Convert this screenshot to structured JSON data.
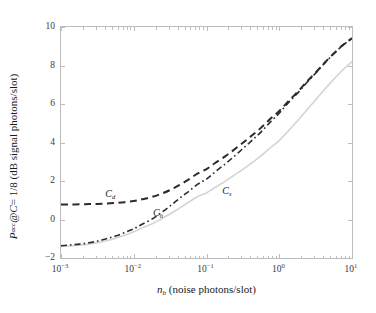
{
  "figure": {
    "xlabel_prefix": "n",
    "xlabel_sub": "b",
    "xlabel_rest": " (noise photons/slot)",
    "ylabel_p": "P",
    "ylabel_p_sub": "acc",
    "ylabel_mid": " @ ",
    "ylabel_c": "C",
    "ylabel_eq": " = 1/8 (dB signal photons/slot)"
  },
  "chart_data": {
    "type": "line",
    "title": "",
    "xlabel": "n_b (noise photons/slot)",
    "ylabel": "P_acc @ C = 1/8 (dB signal photons/slot)",
    "xscale": "log",
    "yscale": "linear",
    "xlim": [
      0.001,
      10
    ],
    "ylim": [
      -2,
      10
    ],
    "grid": false,
    "legend": "inline-annotations",
    "xticks": [
      "10^-3",
      "10^-2",
      "10^-1",
      "10^0",
      "10^1"
    ],
    "xtick_values": [
      0.001,
      0.01,
      0.1,
      1,
      10
    ],
    "yticks": [
      "-2",
      "0",
      "2",
      "4",
      "6",
      "8",
      "10"
    ],
    "ytick_values": [
      -2,
      0,
      2,
      4,
      6,
      8,
      10
    ],
    "annotations": [
      {
        "label": "C",
        "sub": "d",
        "x": 0.0042,
        "y": 1.28
      },
      {
        "label": "C",
        "sub": "h",
        "x": 0.019,
        "y": 0.3
      },
      {
        "label": "C",
        "sub": "s",
        "x": 0.17,
        "y": 1.42
      }
    ],
    "series": [
      {
        "name": "C_d",
        "style": "dashed",
        "color": "#2b2b2b",
        "width": 2.0,
        "x": [
          0.001,
          0.0013,
          0.0018,
          0.0024,
          0.0032,
          0.0042,
          0.0056,
          0.0075,
          0.01,
          0.013,
          0.018,
          0.024,
          0.032,
          0.042,
          0.056,
          0.075,
          0.1,
          0.13,
          0.18,
          0.24,
          0.32,
          0.42,
          0.56,
          0.75,
          1.0,
          1.3,
          1.8,
          2.4,
          3.2,
          4.2,
          5.6,
          7.5,
          10.0
        ],
        "y": [
          0.78,
          0.78,
          0.79,
          0.8,
          0.81,
          0.83,
          0.86,
          0.9,
          0.96,
          1.05,
          1.18,
          1.34,
          1.54,
          1.78,
          2.06,
          2.38,
          2.62,
          2.92,
          3.28,
          3.63,
          4.0,
          4.36,
          4.76,
          5.22,
          5.64,
          6.1,
          6.64,
          7.16,
          7.65,
          8.14,
          8.62,
          9.06,
          9.42
        ]
      },
      {
        "name": "C_h",
        "style": "dashdot",
        "color": "#2b2b2b",
        "width": 1.6,
        "x": [
          0.001,
          0.0013,
          0.0018,
          0.0024,
          0.0032,
          0.0042,
          0.0056,
          0.0075,
          0.01,
          0.013,
          0.018,
          0.024,
          0.032,
          0.042,
          0.056,
          0.075,
          0.1,
          0.13,
          0.18,
          0.24,
          0.32,
          0.42,
          0.56,
          0.75,
          1.0,
          1.3,
          1.8,
          2.4,
          3.2,
          4.2,
          5.6,
          7.5,
          10.0
        ],
        "y": [
          -1.36,
          -1.33,
          -1.28,
          -1.21,
          -1.12,
          -1.0,
          -0.86,
          -0.68,
          -0.48,
          -0.25,
          0.03,
          0.36,
          0.72,
          1.08,
          1.44,
          1.82,
          2.1,
          2.46,
          2.88,
          3.28,
          3.7,
          4.1,
          4.54,
          5.06,
          5.52,
          6.02,
          6.58,
          7.12,
          7.62,
          8.12,
          8.6,
          9.05,
          9.42
        ]
      },
      {
        "name": "C_s",
        "style": "solid",
        "color": "#d4d4d4",
        "width": 1.6,
        "x": [
          0.001,
          0.0013,
          0.0018,
          0.0024,
          0.0032,
          0.0042,
          0.0056,
          0.0075,
          0.01,
          0.013,
          0.018,
          0.024,
          0.032,
          0.042,
          0.056,
          0.075,
          0.1,
          0.13,
          0.18,
          0.24,
          0.32,
          0.42,
          0.56,
          0.75,
          1.0,
          1.3,
          1.8,
          2.4,
          3.2,
          4.2,
          5.6,
          7.5,
          10.0
        ],
        "y": [
          -1.4,
          -1.38,
          -1.34,
          -1.28,
          -1.2,
          -1.1,
          -0.97,
          -0.82,
          -0.64,
          -0.44,
          -0.22,
          0.04,
          0.3,
          0.58,
          0.88,
          1.18,
          1.38,
          1.66,
          1.98,
          2.3,
          2.62,
          2.94,
          3.3,
          3.72,
          4.1,
          4.56,
          5.14,
          5.7,
          6.24,
          6.76,
          7.28,
          7.78,
          8.2
        ]
      }
    ]
  }
}
